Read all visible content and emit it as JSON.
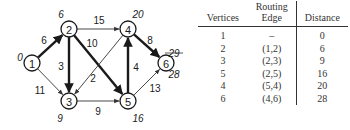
{
  "graph": {
    "nodes": [
      {
        "id": "1",
        "x": 32,
        "y": 63,
        "distance": "0",
        "dx": 20,
        "dy": 57
      },
      {
        "id": "2",
        "x": 69,
        "y": 29,
        "distance": "6",
        "dx": 61,
        "dy": 14
      },
      {
        "id": "3",
        "x": 69,
        "y": 101,
        "distance": "9",
        "dx": 60,
        "dy": 118
      },
      {
        "id": "4",
        "x": 128,
        "y": 29,
        "distance": "20",
        "dx": 138,
        "dy": 14
      },
      {
        "id": "5",
        "x": 128,
        "y": 101,
        "distance": "16",
        "dx": 138,
        "dy": 118
      },
      {
        "id": "6",
        "x": 166,
        "y": 63,
        "distance": "28",
        "dx": 174,
        "dy": 74,
        "struck_distance": "29"
      }
    ],
    "edges": [
      {
        "from": "1",
        "to": "2",
        "weight": "6",
        "bold": true
      },
      {
        "from": "1",
        "to": "3",
        "weight": "11",
        "bold": false
      },
      {
        "from": "2",
        "to": "3",
        "weight": "3",
        "bold": true
      },
      {
        "from": "2",
        "to": "4",
        "weight": "15",
        "bold": false
      },
      {
        "from": "2",
        "to": "5",
        "weight": "10",
        "bold": true
      },
      {
        "from": "4",
        "to": "3",
        "weight": "2",
        "bold": false
      },
      {
        "from": "3",
        "to": "5",
        "weight": "9",
        "bold": false
      },
      {
        "from": "5",
        "to": "4",
        "weight": "4",
        "bold": true
      },
      {
        "from": "4",
        "to": "6",
        "weight": "8",
        "bold": true
      },
      {
        "from": "5",
        "to": "6",
        "weight": "13",
        "bold": false
      }
    ]
  },
  "table": {
    "headers": {
      "vertices": "Vertices",
      "routing_top": "Routing",
      "routing_bottom": "Edge",
      "distance": "Distance"
    },
    "rows": [
      {
        "vertex": "1",
        "edge": "–",
        "distance": "0"
      },
      {
        "vertex": "2",
        "edge": "(1,2)",
        "distance": "6"
      },
      {
        "vertex": "3",
        "edge": "(2,3)",
        "distance": "9"
      },
      {
        "vertex": "5",
        "edge": "(2,5)",
        "distance": "16"
      },
      {
        "vertex": "4",
        "edge": "(5,4)",
        "distance": "20"
      },
      {
        "vertex": "6",
        "edge": "(4,6)",
        "distance": "28"
      }
    ]
  }
}
